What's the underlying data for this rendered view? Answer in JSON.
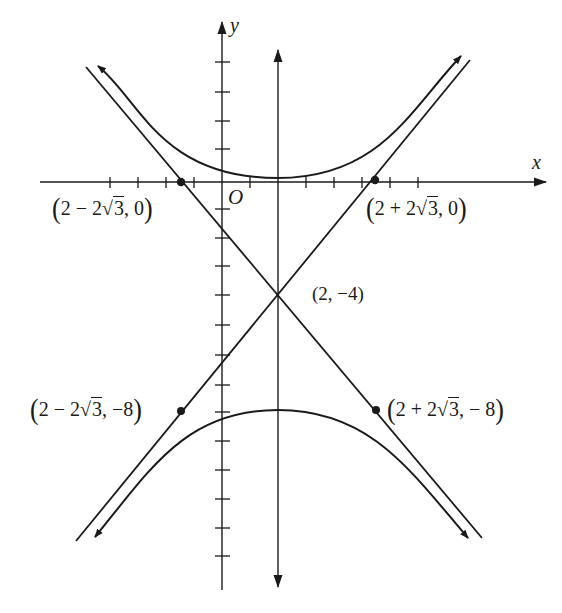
{
  "diagram": {
    "type": "hyperbola-graph",
    "axes": {
      "x_label": "x",
      "y_label": "y",
      "origin_label": "O",
      "x_ticks": [
        -4,
        -3,
        -2,
        -1,
        1,
        2,
        3,
        4,
        5,
        6,
        7,
        8
      ],
      "y_ticks": [
        4,
        3,
        2,
        1,
        -1,
        -2,
        -3,
        -4,
        -5,
        -6,
        -7,
        -8,
        -9,
        -10,
        -11,
        -12,
        -13,
        -14
      ]
    },
    "center": {
      "label": "(2, −4)",
      "x": 2,
      "y": -4
    },
    "points": [
      {
        "id": "p1",
        "pre": "2 − 2",
        "rad": "3",
        "post": ", 0",
        "x_expr": "2 − 2√3",
        "y": 0
      },
      {
        "id": "p2",
        "pre": "2 + 2",
        "rad": "3",
        "post": ", 0",
        "x_expr": "2 + 2√3",
        "y": 0
      },
      {
        "id": "p3",
        "pre": "2 − 2",
        "rad": "3",
        "post": ", −8",
        "x_expr": "2 − 2√3",
        "y": -8
      },
      {
        "id": "p4",
        "pre": "2 + 2",
        "rad": "3",
        "post": ", − 8",
        "x_expr": "2 + 2√3",
        "y": -8
      }
    ],
    "curves": {
      "hyperbola": "vertical transverse axis centered at (2, −4), two branches opening up and down",
      "asymptotes": [
        "line through (2−2√3, 0) and (2, −4) and (2+2√3, −8)",
        "line through (2+2√3, 0) and (2, −4) and (2−2√3, −8)"
      ],
      "axis_of_symmetry": "x = 2"
    },
    "colors": {
      "ink": "#1a1a1a",
      "background": "#ffffff"
    }
  }
}
